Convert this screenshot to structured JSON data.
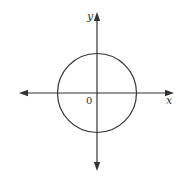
{
  "diagram": {
    "type": "coordinate-plane-with-circle",
    "labels": {
      "x_axis": "x",
      "y_axis": "y",
      "origin": "0"
    },
    "colors": {
      "stroke": "#333333",
      "background": "#ffffff"
    },
    "geometry": {
      "origin_px": [
        97,
        93
      ],
      "circle_center_px": [
        97,
        93
      ],
      "circle_radius_px": 39.5,
      "x_axis_extent_px": [
        19,
        174
      ],
      "y_axis_extent_px": [
        12,
        171
      ]
    },
    "elements": [
      "horizontal axis with arrowheads at both ends",
      "vertical axis with arrowheads at both ends",
      "circle centered at origin"
    ]
  }
}
